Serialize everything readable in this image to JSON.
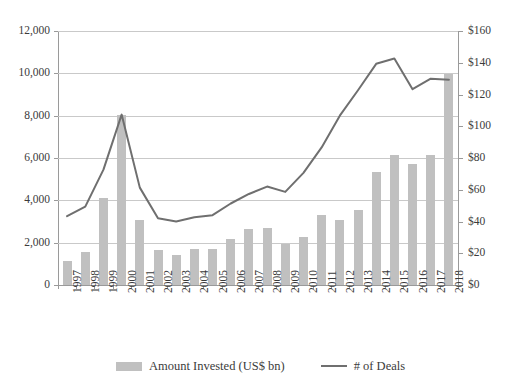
{
  "chart_data": {
    "type": "bar",
    "title": "",
    "xlabel": "",
    "ylabel": "",
    "grid": true,
    "legend_position": "bottom",
    "categories": [
      "1997",
      "1998",
      "1999",
      "2000",
      "2001",
      "2002",
      "2003",
      "2004",
      "2005",
      "2006",
      "2007",
      "2008",
      "2009",
      "2010",
      "2011",
      "2012",
      "2013",
      "2014",
      "2015",
      "2016",
      "2017",
      "2018"
    ],
    "series": [
      {
        "name": "Amount Invested  (US$ bn)",
        "type": "bar",
        "axis": "right",
        "color": "#c0c0c0",
        "values": [
          15,
          21,
          55,
          107,
          41,
          22,
          19,
          23,
          23,
          29,
          35,
          36,
          26,
          30,
          44,
          41,
          47,
          71,
          82,
          76,
          82,
          133
        ]
      },
      {
        "name": "# of Deals",
        "type": "line",
        "axis": "left",
        "color": "#6f6f6f",
        "values": [
          3250,
          3700,
          5450,
          8050,
          4600,
          3150,
          3000,
          3200,
          3300,
          3850,
          4300,
          4650,
          4400,
          5300,
          6500,
          8000,
          9200,
          10450,
          10700,
          9250,
          9750,
          9700
        ]
      }
    ],
    "left_axis": {
      "label": "",
      "min": 0,
      "max": 12000,
      "step": 2000,
      "ticks": [
        "0",
        "2,000",
        "4,000",
        "6,000",
        "8,000",
        "10,000",
        "12,000"
      ]
    },
    "right_axis": {
      "label": "",
      "min": 0,
      "max": 160,
      "step": 20,
      "ticks": [
        "$0",
        "$20",
        "$40",
        "$60",
        "$80",
        "$100",
        "$120",
        "$140",
        "$160"
      ]
    }
  },
  "legend": {
    "items": [
      {
        "label": "Amount Invested  (US$ bn)",
        "marker": "bar-swatch"
      },
      {
        "label": "# of Deals",
        "marker": "line-swatch"
      }
    ]
  }
}
